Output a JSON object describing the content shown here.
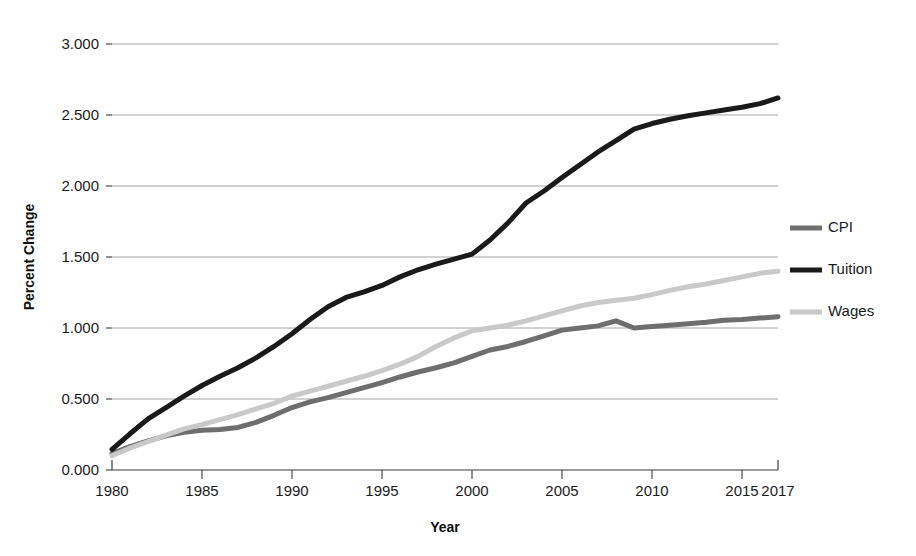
{
  "chart_data": {
    "type": "line",
    "title": "",
    "xlabel": "Year",
    "ylabel": "Percent Change",
    "xlim": [
      1980,
      2017
    ],
    "ylim": [
      0.0,
      3.0
    ],
    "grid": true,
    "legend_position": "right",
    "x_ticks": [
      "1980",
      "1985",
      "1990",
      "1995",
      "2000",
      "2005",
      "2010",
      "2015",
      "2017"
    ],
    "x_tick_values": [
      1980,
      1985,
      1990,
      1995,
      2000,
      2005,
      2010,
      2015,
      2017
    ],
    "y_ticks": [
      "0.000",
      "0.500",
      "1.000",
      "1.500",
      "2.000",
      "2.500",
      "3.000"
    ],
    "y_tick_values": [
      0.0,
      0.5,
      1.0,
      1.5,
      2.0,
      2.5,
      3.0
    ],
    "x": [
      1980,
      1981,
      1982,
      1983,
      1984,
      1985,
      1986,
      1987,
      1988,
      1989,
      1990,
      1991,
      1992,
      1993,
      1994,
      1995,
      1996,
      1997,
      1998,
      1999,
      2000,
      2001,
      2002,
      2003,
      2004,
      2005,
      2006,
      2007,
      2008,
      2009,
      2010,
      2011,
      2012,
      2013,
      2014,
      2015,
      2016,
      2017
    ],
    "series": [
      {
        "name": "CPI",
        "color": "#6e6e6e",
        "width": 5,
        "values": [
          0.115,
          0.165,
          0.205,
          0.24,
          0.265,
          0.28,
          0.285,
          0.3,
          0.335,
          0.385,
          0.44,
          0.48,
          0.51,
          0.545,
          0.58,
          0.615,
          0.655,
          0.69,
          0.72,
          0.755,
          0.8,
          0.845,
          0.87,
          0.905,
          0.945,
          0.985,
          1.0,
          1.015,
          1.05,
          1.0,
          1.01,
          1.02,
          1.03,
          1.04,
          1.055,
          1.06,
          1.07,
          1.08
        ]
      },
      {
        "name": "Tuition",
        "color": "#1a1a1a",
        "width": 5,
        "values": [
          0.145,
          0.255,
          0.36,
          0.44,
          0.52,
          0.595,
          0.66,
          0.72,
          0.79,
          0.87,
          0.96,
          1.06,
          1.15,
          1.215,
          1.255,
          1.3,
          1.36,
          1.41,
          1.45,
          1.485,
          1.52,
          1.62,
          1.74,
          1.88,
          1.965,
          2.06,
          2.15,
          2.24,
          2.32,
          2.4,
          2.44,
          2.47,
          2.495,
          2.515,
          2.535,
          2.555,
          2.58,
          2.62
        ]
      },
      {
        "name": "Wages",
        "color": "#c9c9c9",
        "width": 5,
        "values": [
          0.1,
          0.155,
          0.2,
          0.245,
          0.29,
          0.32,
          0.355,
          0.39,
          0.43,
          0.47,
          0.52,
          0.555,
          0.59,
          0.625,
          0.66,
          0.7,
          0.745,
          0.8,
          0.87,
          0.93,
          0.98,
          1.0,
          1.02,
          1.05,
          1.085,
          1.12,
          1.155,
          1.18,
          1.195,
          1.21,
          1.235,
          1.265,
          1.29,
          1.31,
          1.335,
          1.36,
          1.385,
          1.4
        ]
      }
    ]
  },
  "legend": {
    "items": [
      {
        "label": "CPI"
      },
      {
        "label": "Tuition"
      },
      {
        "label": "Wages"
      }
    ]
  },
  "axes": {
    "y_title": "Percent Change",
    "x_title": "Year"
  }
}
